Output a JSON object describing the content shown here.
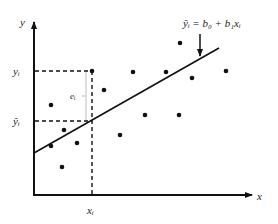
{
  "diagram": {
    "axes": {
      "x_label": "x",
      "y_label": "y",
      "origin": [
        34,
        195
      ],
      "x_end": [
        254,
        195
      ],
      "y_end": [
        34,
        20
      ]
    },
    "regression_line": {
      "equation_label": "ŷᵢ = b₀ + b₁xᵢ",
      "start": [
        34,
        153
      ],
      "end": [
        219,
        48
      ]
    },
    "annotations": {
      "yi_label": "yᵢ",
      "yhat_label": "ŷᵢ",
      "xi_label": "xᵢ",
      "residual_label": "eᵢ"
    },
    "highlight_point": {
      "x": 92,
      "y": 71,
      "y_hat": 121
    },
    "points": [
      [
        51,
        105
      ],
      [
        64,
        130
      ],
      [
        51,
        146
      ],
      [
        77,
        143
      ],
      [
        62,
        167
      ],
      [
        92,
        71
      ],
      [
        104,
        90
      ],
      [
        133,
        72
      ],
      [
        120,
        135
      ],
      [
        145,
        115
      ],
      [
        166,
        72
      ],
      [
        179,
        115
      ],
      [
        180,
        43
      ],
      [
        192,
        78
      ],
      [
        226,
        71
      ]
    ],
    "colors": {
      "ink": "#111111",
      "guide": "#bbbbbb"
    }
  }
}
